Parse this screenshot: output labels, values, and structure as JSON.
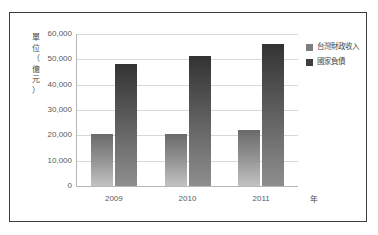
{
  "chart_data": {
    "type": "bar",
    "title": "",
    "subtitle": "",
    "categories": [
      "2009",
      "2010",
      "2011"
    ],
    "series": [
      {
        "name": "台灣財政收入",
        "values": [
          20700,
          20700,
          22300
        ],
        "color": "#7e7e7e"
      },
      {
        "name": "國家負債",
        "values": [
          48000,
          51500,
          56000
        ],
        "color": "#3f3f3f"
      }
    ],
    "xlabel": "年",
    "ylabel": "單位（億元）",
    "ylim": [
      0,
      60000
    ],
    "yticks": [
      0,
      10000,
      20000,
      30000,
      40000,
      50000,
      60000
    ],
    "ytick_labels": [
      "0",
      "10,000",
      "20,000",
      "30,000",
      "40,000",
      "50,000",
      "60,000"
    ],
    "grid": true,
    "legend_position": "right-top"
  },
  "axes": {
    "y_title_chars": [
      "單",
      "位",
      "（",
      "億",
      "元",
      "）"
    ],
    "x_title": "年"
  },
  "legend": {
    "items": [
      {
        "label": "台灣財政收入",
        "swatch": "#7e7e7e"
      },
      {
        "label": "國家負債",
        "swatch": "#3f3f3f"
      }
    ]
  },
  "frame": {
    "border_color": "#3c3c3c",
    "background": "#ffffff"
  }
}
